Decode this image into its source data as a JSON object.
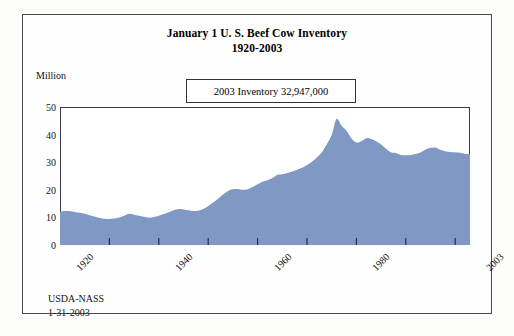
{
  "document": {
    "footer_line1": "USDA-NASS",
    "footer_line2": "1-31-2003"
  },
  "annotation": {
    "text": "2003 Inventory 32,947,000"
  },
  "chart_data": {
    "type": "area",
    "title": "January 1 U. S. Beef Cow Inventory",
    "subtitle": "1920-2003",
    "xlabel": "",
    "ylabel": "Million",
    "ylim": [
      0,
      50
    ],
    "xlim": [
      1920,
      2003
    ],
    "yticks": [
      0,
      10,
      20,
      30,
      40,
      50
    ],
    "xticks": [
      1920,
      1940,
      1960,
      1980,
      2003
    ],
    "grid": false,
    "legend": false,
    "series_color": "#8099c4",
    "x": [
      1920,
      1921,
      1922,
      1923,
      1924,
      1925,
      1926,
      1927,
      1928,
      1929,
      1930,
      1931,
      1932,
      1933,
      1934,
      1935,
      1936,
      1937,
      1938,
      1939,
      1940,
      1941,
      1942,
      1943,
      1944,
      1945,
      1946,
      1947,
      1948,
      1949,
      1950,
      1951,
      1952,
      1953,
      1954,
      1955,
      1956,
      1957,
      1958,
      1959,
      1960,
      1961,
      1962,
      1963,
      1964,
      1965,
      1966,
      1967,
      1968,
      1969,
      1970,
      1971,
      1972,
      1973,
      1974,
      1975,
      1976,
      1977,
      1978,
      1979,
      1980,
      1981,
      1982,
      1983,
      1984,
      1985,
      1986,
      1987,
      1988,
      1989,
      1990,
      1991,
      1992,
      1993,
      1994,
      1995,
      1996,
      1997,
      1998,
      1999,
      2000,
      2001,
      2002,
      2003
    ],
    "values": [
      12.1,
      12.3,
      12.2,
      12.0,
      11.7,
      11.3,
      10.8,
      10.3,
      9.8,
      9.5,
      9.4,
      9.6,
      10.0,
      10.6,
      11.3,
      11.0,
      10.6,
      10.2,
      9.9,
      10.1,
      10.6,
      11.2,
      11.9,
      12.6,
      13.0,
      12.9,
      12.6,
      12.3,
      12.4,
      13.0,
      14.1,
      15.4,
      16.8,
      18.3,
      19.6,
      20.2,
      20.3,
      20.0,
      20.2,
      21.0,
      22.0,
      22.9,
      23.5,
      24.3,
      25.4,
      25.6,
      26.1,
      26.6,
      27.3,
      28.0,
      29.0,
      30.2,
      31.7,
      33.6,
      36.5,
      39.9,
      45.7,
      43.2,
      41.4,
      38.7,
      37.1,
      37.6,
      38.7,
      38.4,
      37.6,
      36.4,
      34.9,
      33.6,
      33.3,
      32.6,
      32.5,
      32.6,
      33.0,
      33.5,
      34.6,
      35.2,
      35.3,
      34.5,
      34.0,
      33.7,
      33.6,
      33.4,
      33.1,
      32.9
    ]
  }
}
